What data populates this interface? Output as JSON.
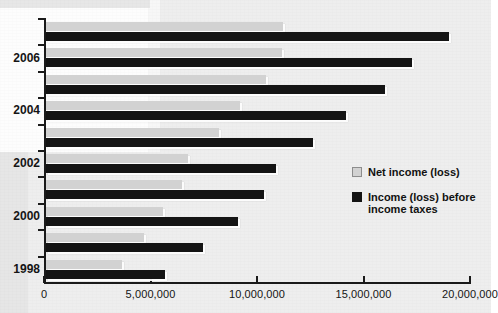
{
  "chart_data": {
    "type": "bar",
    "orientation": "horizontal",
    "title": "",
    "xlabel": "",
    "ylabel": "",
    "grid": false,
    "legend_position": "right-middle",
    "xlim": [
      0,
      20000000
    ],
    "xticks": [
      0,
      5000000,
      10000000,
      15000000,
      20000000
    ],
    "xtick_labels": [
      "0",
      "5,000,000",
      "10,000,000",
      "15,000,000",
      "20,000,000"
    ],
    "categories": [
      "1998",
      "1999",
      "2000",
      "2001",
      "2002",
      "2003",
      "2004",
      "2005",
      "2006",
      "2007"
    ],
    "category_labels_shown": [
      "1998",
      "",
      "2000",
      "",
      "2002",
      "",
      "2004",
      "",
      "2006",
      ""
    ],
    "series": [
      {
        "name": "Net income (loss)",
        "color": "#d2d2d2",
        "values": [
          3550000,
          4600000,
          5500000,
          6400000,
          6650000,
          8100000,
          9100000,
          10350000,
          11100000,
          11150000
        ]
      },
      {
        "name": "Income (loss) before income taxes",
        "color": "#141414",
        "values": [
          5600000,
          7350000,
          9000000,
          10250000,
          10800000,
          12550000,
          14100000,
          15900000,
          17200000,
          18900000
        ]
      }
    ]
  },
  "legend": {
    "items": [
      {
        "label": "Net income (loss)",
        "swatch": "net"
      },
      {
        "label": "Income (loss) before income taxes",
        "swatch": "pretax"
      }
    ]
  }
}
